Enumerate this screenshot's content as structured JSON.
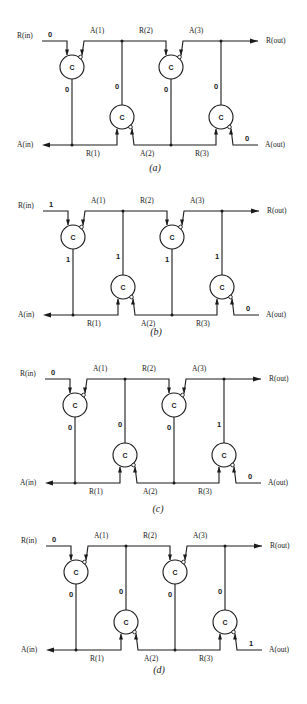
{
  "labels": {
    "r_in": "R(in)",
    "a_in": "A(in)",
    "r_out": "R(out)",
    "a_out": "A(out)",
    "a1": "A(1)",
    "r2": "R(2)",
    "a3": "A(3)",
    "r1": "R(1)",
    "a2": "A(2)",
    "r3": "R(3)",
    "gate": "C"
  },
  "panels": [
    {
      "caption": "(a)",
      "dx": 0,
      "top_y": 41,
      "r_in_value": "0",
      "wire_values": [
        "0",
        "0",
        "0",
        "0"
      ],
      "a_out_value": "0"
    },
    {
      "caption": "(b)",
      "dx": 1,
      "top_y": 211,
      "r_in_value": "1",
      "wire_values": [
        "1",
        "1",
        "1",
        "1"
      ],
      "a_out_value": "0"
    },
    {
      "caption": "(c)",
      "dx": 3,
      "top_y": 379,
      "r_in_value": "0",
      "wire_values": [
        "0",
        "0",
        "0",
        "1"
      ],
      "a_out_value": "0"
    },
    {
      "caption": "(d)",
      "dx": 4,
      "top_y": 546,
      "r_in_value": "0",
      "wire_values": [
        "0",
        "0",
        "0",
        "0"
      ],
      "a_out_value": "1"
    }
  ]
}
